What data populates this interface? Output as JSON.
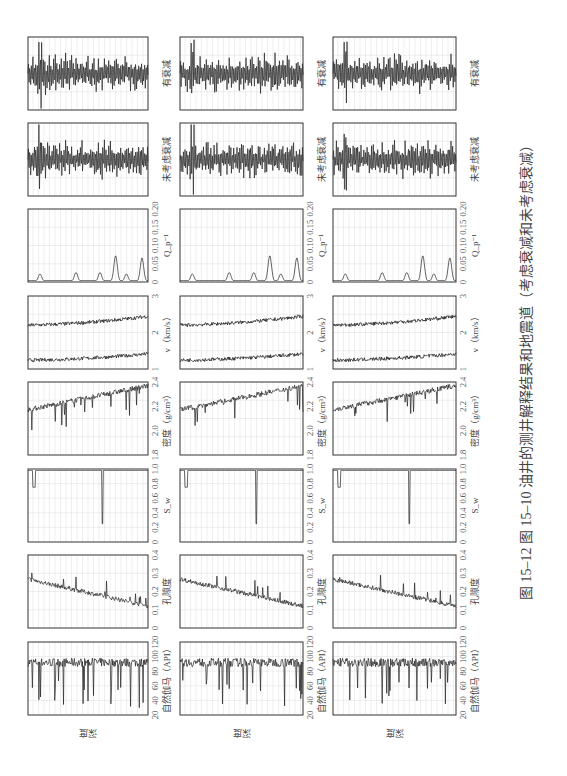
{
  "caption": "图 15–12   图 15–10 油井的测井解释结果和地震道（考虑衰减和未考虑衰减）",
  "depth_label": "深度",
  "orientation": "rotated 90° counterclockwise",
  "chart_data": {
    "type": "line",
    "title": "图 15–12 图 15–10 油井的测井解释结果和地震道（考虑衰减和未考虑衰减）",
    "ylabel": "深度",
    "n_wells_panels": 3,
    "tracks": [
      {
        "key": "gr",
        "label": "自然伽马（API）",
        "ticks": [
          "20",
          "40",
          "60",
          "80",
          "100",
          "120"
        ],
        "xlim": [
          20,
          120
        ],
        "baseline": 95,
        "spikes_down_to": 30
      },
      {
        "key": "phi",
        "label": "孔隙度",
        "ticks": [
          "0",
          "0.1",
          "0.2",
          "0.3",
          "0.4"
        ],
        "xlim": [
          0,
          0.4
        ],
        "trend": [
          0.27,
          0.12
        ]
      },
      {
        "key": "sw",
        "label": "S_w",
        "ticks": [
          "0",
          "0.2",
          "0.4",
          "0.6",
          "0.8",
          "1.0"
        ],
        "xlim": [
          0,
          1.0
        ],
        "baseline": 1.0,
        "dips": [
          0.75,
          0.25
        ]
      },
      {
        "key": "rho",
        "label": "密度（g/cm³）",
        "ticks": [
          "1.8",
          "2.0",
          "2.2",
          "2.4"
        ],
        "xlim": [
          1.8,
          2.4
        ],
        "trend": [
          2.2,
          2.38
        ]
      },
      {
        "key": "v",
        "label": "v（km/s）",
        "ticks": [
          "1",
          "2",
          "3"
        ],
        "xlim": [
          0.6,
          3.5
        ],
        "series": [
          {
            "name": "Vs",
            "trend": [
              0.8,
              1.5
            ]
          },
          {
            "name": "Vp",
            "trend": [
              2.2,
              3.0
            ]
          }
        ]
      },
      {
        "key": "q",
        "label": "Q_p⁻¹",
        "ticks": [
          "0",
          "0.05",
          "0.10",
          "0.15",
          "0.20"
        ],
        "xlim": [
          0,
          0.2
        ],
        "peaks": [
          0.02,
          0.03,
          0.03,
          0.07,
          0.03,
          0.07
        ]
      },
      {
        "key": "seis1",
        "label": "未考虑衰减",
        "ticks": [],
        "type": "seismic trace"
      },
      {
        "key": "seis2",
        "label": "有衰减",
        "ticks": [],
        "type": "seismic trace"
      }
    ],
    "grid": true
  }
}
